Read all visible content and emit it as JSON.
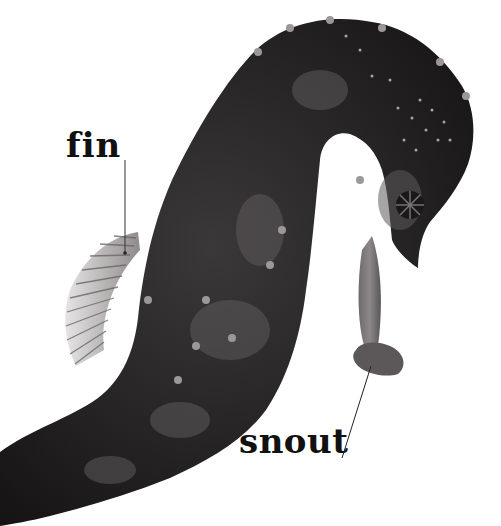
{
  "image": {
    "subject": "seahorse",
    "background_color": "#ffffff",
    "body_color": "#1e1c1d",
    "highlight_color": "#8a8788"
  },
  "labels": [
    {
      "id": "fin",
      "text": "fin"
    },
    {
      "id": "snout",
      "text": "snout"
    }
  ]
}
